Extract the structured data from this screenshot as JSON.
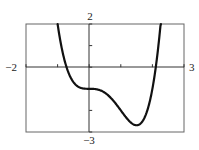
{
  "chart_data": {
    "type": "line",
    "title": "",
    "xlabel": "",
    "ylabel": "",
    "xlim": [
      -2,
      3
    ],
    "ylim": [
      -3,
      2
    ],
    "grid": false,
    "legend": null,
    "function": "f(x) = x^4 - 2x^3 - 1",
    "tick_labels": {
      "xmin": "−2",
      "xmax": "3",
      "ymax": "2",
      "ymin": "−3"
    },
    "x_ticks": [
      -2,
      -1,
      0,
      1,
      2,
      3
    ],
    "y_ticks": [
      -3,
      -2,
      -1,
      0,
      1,
      2
    ],
    "series": [
      {
        "name": "f(x)",
        "x": [
          -1.0,
          -0.9,
          -0.8,
          -0.7,
          -0.6,
          -0.5,
          -0.4,
          -0.3,
          -0.2,
          -0.1,
          0.0,
          0.1,
          0.2,
          0.3,
          0.4,
          0.5,
          0.6,
          0.7,
          0.8,
          0.9,
          1.0,
          1.1,
          1.2,
          1.3,
          1.4,
          1.5,
          1.6,
          1.7,
          1.8,
          1.9,
          2.0,
          2.1,
          2.2,
          2.27
        ],
        "values": [
          2.0,
          1.11,
          0.43,
          -0.07,
          -0.44,
          -0.69,
          -0.85,
          -0.94,
          -0.98,
          -1.0,
          -1.0,
          -1.0,
          -1.01,
          -1.05,
          -1.1,
          -1.19,
          -1.3,
          -1.45,
          -1.61,
          -1.8,
          -2.0,
          -2.2,
          -2.38,
          -2.54,
          -2.65,
          -2.69,
          -2.64,
          -2.48,
          -2.16,
          -1.68,
          -1.0,
          -0.07,
          1.12,
          2.0
        ]
      }
    ],
    "annotations": {
      "local_min": {
        "x": 1.5,
        "y": -2.69
      },
      "inflection_flat": {
        "x": 0,
        "y": -1
      }
    }
  },
  "labels": {
    "xmin": "−2",
    "xmax": "3",
    "ymax": "2",
    "ymin": "−3"
  },
  "colors": {
    "curve": "#111111",
    "frame": "#555555",
    "axis": "#333333"
  }
}
